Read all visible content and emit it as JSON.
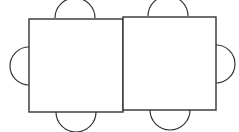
{
  "diagram": {
    "stroke_color": "#333333",
    "background": "#ffffff",
    "tables": [
      {
        "name": "left-table",
        "x": 29,
        "y": 19,
        "w": 94,
        "h": 93
      },
      {
        "name": "right-table",
        "x": 123,
        "y": 17,
        "w": 93,
        "h": 93
      }
    ],
    "chairs": [
      {
        "name": "chair-top-left",
        "side": "top",
        "cx": 75,
        "cy": 18,
        "r": 20
      },
      {
        "name": "chair-top-right",
        "side": "top",
        "cx": 168,
        "cy": 16,
        "r": 20
      },
      {
        "name": "chair-bottom-left",
        "side": "bottom",
        "cx": 76,
        "cy": 112,
        "r": 20
      },
      {
        "name": "chair-bottom-right",
        "side": "bottom",
        "cx": 170,
        "cy": 110,
        "r": 20
      },
      {
        "name": "chair-left",
        "side": "left",
        "cx": 29,
        "cy": 66,
        "r": 19
      },
      {
        "name": "chair-right",
        "side": "right",
        "cx": 216,
        "cy": 64,
        "r": 19
      }
    ]
  }
}
